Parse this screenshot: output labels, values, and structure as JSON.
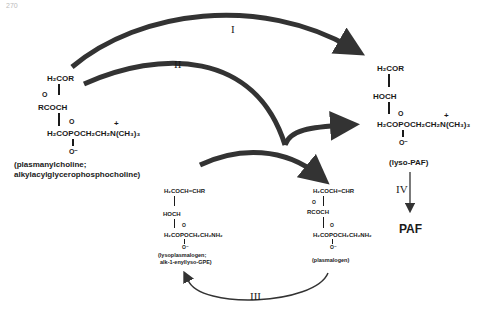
{
  "page_number": "270",
  "steps": {
    "I": "I",
    "II": "II",
    "III": "III",
    "IV": "IV"
  },
  "compounds": {
    "plasmanylcholine": {
      "line1": "H₂COR",
      "o_top": "O",
      "line2": "RCOCH",
      "o_p": "O",
      "plus": "+",
      "line3": "H₂COPOCH₂CH₂N(CH₃)₃",
      "o_minus": "O⁻",
      "name1": "(plasmanylcholine;",
      "name2": "alkylacylglycerophosphocholine)"
    },
    "lyso_paf": {
      "line1": "H₂COR",
      "line2": "HOCH",
      "o_p": "O",
      "plus": "+",
      "line3": "H₂COPOCH₂CH₂N(CH₃)₃",
      "o_minus": "O⁻",
      "name": "(lyso-PAF)"
    },
    "lysoplasmalogen": {
      "line1": "H₂COCH=CHR",
      "line2": "HOCH",
      "o_p": "O",
      "line3": "H₂COPOCH₂CH₂NH₂",
      "o_minus": "O⁻",
      "name1": "(lysoplasmalogen;",
      "name2": "alk-1-enyllyso-GPE)"
    },
    "plasmalogen": {
      "line1": "H₂COCH=CHR",
      "o_top": "O",
      "line2": "RCOCH",
      "o_p": "O",
      "line3": "H₂COPOCH₂CH₂NH₂",
      "o_minus": "O⁻",
      "name": "(plasmalogen)"
    },
    "paf": {
      "name": "PAF"
    }
  }
}
